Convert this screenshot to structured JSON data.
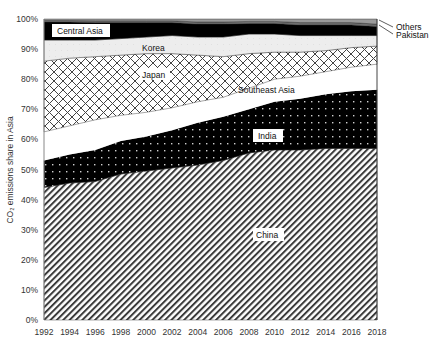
{
  "chart_data": {
    "type": "area",
    "stacked": true,
    "title": "",
    "xlabel": "",
    "ylabel": "CO₂ emissions share in Asia",
    "ylim": [
      0,
      100
    ],
    "yticks": [
      "0%",
      "10%",
      "20%",
      "30%",
      "40%",
      "50%",
      "60%",
      "70%",
      "80%",
      "90%",
      "100%"
    ],
    "xticks": [
      "1992",
      "1994",
      "1996",
      "1998",
      "2000",
      "2002",
      "2004",
      "2006",
      "2008",
      "2010",
      "2012",
      "2014",
      "2016",
      "2018"
    ],
    "grid": false,
    "legend": "inline labels",
    "x": [
      1992,
      1994,
      1996,
      1998,
      2000,
      2002,
      2004,
      2006,
      2008,
      2010,
      2012,
      2014,
      2016,
      2018
    ],
    "series": [
      {
        "name": "China",
        "pattern": "diagonal-hatch",
        "values": [
          44,
          45.5,
          46,
          48.5,
          49.5,
          50.5,
          51.5,
          53,
          55.5,
          56.5,
          56.5,
          57,
          57,
          57
        ]
      },
      {
        "name": "India",
        "pattern": "black-dotted",
        "values": [
          9,
          9.5,
          10.5,
          11,
          11.5,
          12.5,
          14,
          14.5,
          14.5,
          16,
          17,
          18,
          19,
          19.5
        ]
      },
      {
        "name": "Southeast Asia",
        "pattern": "white",
        "values": [
          9.5,
          9.5,
          10,
          8.5,
          8,
          7.5,
          7,
          6.5,
          7,
          7.5,
          7.5,
          7.5,
          8,
          8.5
        ]
      },
      {
        "name": "Japan",
        "pattern": "crosshatch",
        "values": [
          23.5,
          22.5,
          21,
          20,
          19.5,
          18,
          15.5,
          13.5,
          11.5,
          9,
          8,
          7,
          6.5,
          6
        ]
      },
      {
        "name": "Korea",
        "pattern": "light-gray",
        "values": [
          7,
          6,
          5.5,
          5.5,
          5.5,
          6,
          6,
          6.5,
          6.5,
          6,
          5.5,
          5,
          4,
          3.5
        ]
      },
      {
        "name": "Central Asia",
        "pattern": "black",
        "values": [
          6,
          6,
          5.8,
          5.3,
          4.8,
          4.3,
          4.3,
          4.3,
          3.5,
          3.5,
          3.5,
          3.5,
          3.5,
          3
        ]
      },
      {
        "name": "Pakistan",
        "pattern": "gray",
        "values": [
          0.5,
          0.5,
          0.6,
          0.6,
          0.6,
          0.6,
          0.7,
          0.7,
          0.7,
          0.7,
          0.8,
          0.8,
          0.8,
          0.8
        ]
      },
      {
        "name": "Others",
        "pattern": "mid-gray",
        "values": [
          0.5,
          0.5,
          0.6,
          0.6,
          0.6,
          0.6,
          1.0,
          1.0,
          0.8,
          0.8,
          1.2,
          1.2,
          1.2,
          1.7
        ]
      }
    ],
    "annotations": [
      "Central Asia",
      "Korea",
      "Japan",
      "Southeast Asia",
      "India",
      "China",
      "Others",
      "Pakistan"
    ]
  },
  "labels": {
    "central_asia": "Central Asia",
    "korea": "Korea",
    "japan": "Japan",
    "southeast_asia": "Southeast Asia",
    "india": "India",
    "china": "China",
    "others": "Others",
    "pakistan": "Pakistan"
  }
}
